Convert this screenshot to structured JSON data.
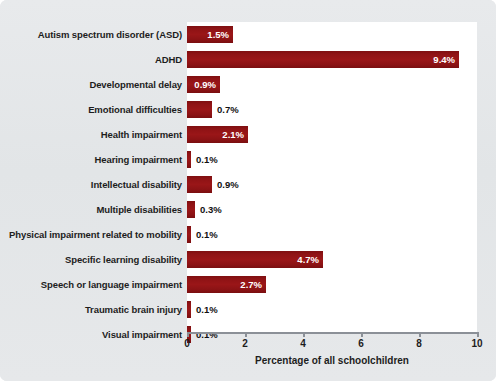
{
  "chart_data": {
    "type": "bar",
    "orientation": "horizontal",
    "title": "",
    "xlabel": "Percentage of all schoolchildren",
    "ylabel": "",
    "xlim": [
      0,
      10
    ],
    "xticks": [
      0,
      2,
      4,
      6,
      8,
      10
    ],
    "grid": false,
    "legend": null,
    "bar_color": "#8d1214",
    "plot_background": "#ffffff",
    "figure_background": "#e3e6e8",
    "categories": [
      "Autism spectrum disorder (ASD)",
      "ADHD",
      "Developmental delay",
      "Emotional difficulties",
      "Health impairment",
      "Hearing impairment",
      "Intellectual disability",
      "Multiple disabilities",
      "Physical impairment related to mobility",
      "Specific learning disability",
      "Speech or language impairment",
      "Traumatic brain injury",
      "Visual impairment"
    ],
    "values": [
      1.5,
      9.4,
      0.9,
      0.7,
      2.1,
      0.1,
      0.9,
      0.3,
      0.1,
      4.7,
      2.7,
      0.1,
      0.1
    ],
    "value_labels": [
      "1.5%",
      "9.4%",
      "0.9%",
      "0.7%",
      "2.1%",
      "0.1%",
      "0.9%",
      "0.3%",
      "0.1%",
      "4.7%",
      "2.7%",
      "0.1%",
      "0.1%"
    ],
    "label_placement": [
      "inside",
      "inside",
      "inside",
      "outside",
      "inside",
      "outside",
      "outside",
      "outside",
      "outside",
      "inside",
      "inside",
      "outside",
      "outside"
    ],
    "bar_pixel_widths": [
      46,
      272,
      33,
      25,
      61,
      4,
      25,
      8,
      4,
      136,
      79,
      4,
      4
    ]
  }
}
